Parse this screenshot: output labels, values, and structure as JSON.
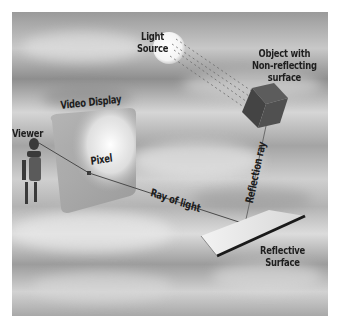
{
  "diagram": {
    "type": "ray-tracing-illustration",
    "labels": {
      "light_source": [
        "Light",
        "Source"
      ],
      "object": [
        "Object with",
        "Non-reflecting",
        "surface"
      ],
      "video_display": "Video Display",
      "viewer": "Viewer",
      "pixel": "Pixel",
      "ray_of_light": "Ray of light",
      "reflection_ray": "Reflection ray",
      "reflective_surface": [
        "Reflective",
        "Surface"
      ]
    },
    "nodes": [
      {
        "id": "light_source",
        "label": "Light Source"
      },
      {
        "id": "object",
        "label": "Object with Non-reflecting surface"
      },
      {
        "id": "reflective_surface",
        "label": "Reflective Surface"
      },
      {
        "id": "video_display",
        "label": "Video Display"
      },
      {
        "id": "pixel",
        "label": "Pixel"
      },
      {
        "id": "viewer",
        "label": "Viewer"
      }
    ],
    "edges": [
      {
        "from": "light_source",
        "to": "object",
        "style": "dashed rays"
      },
      {
        "from": "object",
        "to": "reflective_surface",
        "label": "Reflection ray"
      },
      {
        "from": "reflective_surface",
        "to": "pixel",
        "label": "Ray of light"
      },
      {
        "from": "pixel",
        "to": "viewer"
      }
    ],
    "colors": {
      "ray": "#555555",
      "cube": "#4a4a4a",
      "text": "#1e1e1e"
    }
  }
}
